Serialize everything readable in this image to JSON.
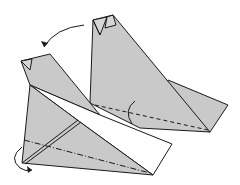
{
  "diagram": {
    "type": "origami-folding-step",
    "colors": {
      "paper": "#c9c9c9",
      "paper_back": "#ffffff",
      "line": "#1a1a1a",
      "background": "#ffffff"
    },
    "elements": {
      "back_plane": "Folded plane (rear view) with valley-fold dashed line and fold arrow",
      "front_plane": "Plane with mountain-fold dash-dot line and turn-over arrow",
      "turn_arrow": "Curved arrow indicating turning the model over",
      "fold_arrow_back": "Small arc arrow on back plane",
      "fold_arrow_front": "Curled arrow at front plane nose"
    }
  }
}
